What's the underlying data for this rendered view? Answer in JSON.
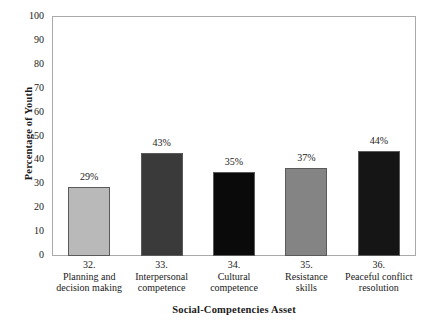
{
  "chart_data": {
    "type": "bar",
    "title": "",
    "xlabel": "Social-Competencies Asset",
    "ylabel": "Percentage of Youth",
    "ylim": [
      0,
      100
    ],
    "ytick_step": 10,
    "grid": false,
    "legend": "none",
    "categories": [
      "32. Planning and decision making",
      "33. Interpersonal competence",
      "34. Cultural competence",
      "35. Resistance skills",
      "36. Peaceful conflict resolution"
    ],
    "values": [
      29,
      43,
      35,
      37,
      44
    ],
    "value_labels": [
      "29%",
      "43%",
      "35%",
      "37%",
      "44%"
    ],
    "yticks": [
      "100",
      "90",
      "80",
      "70",
      "60",
      "50",
      "40",
      "30",
      "20",
      "10",
      "0"
    ],
    "bar_colors": [
      "#b9b9b9",
      "#3a3a3a",
      "#0a0a0a",
      "#848484",
      "#151515"
    ],
    "bar_border_color": "#5a5a5a",
    "axis_color": "#a9a9a9",
    "category_lines": [
      [
        "32.",
        "Planning and",
        "decision making"
      ],
      [
        "33.",
        "Interpersonal",
        "competence"
      ],
      [
        "34.",
        "Cultural",
        "competence"
      ],
      [
        "35.",
        "Resistance",
        "skills"
      ],
      [
        "36.",
        "Peaceful conflict",
        "resolution"
      ]
    ]
  }
}
